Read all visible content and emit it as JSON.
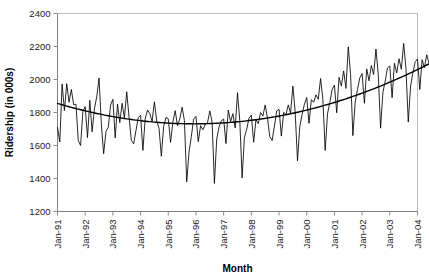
{
  "chart_data": {
    "type": "line",
    "title": "",
    "xlabel": "Month",
    "ylabel": "Ridership (in 000s)",
    "ylim": [
      1200,
      2400
    ],
    "ytick_step": 200,
    "yticks": [
      1200,
      1400,
      1600,
      1800,
      2000,
      2200,
      2400
    ],
    "grid": false,
    "legend": "none",
    "x_tick_labels": [
      "Jan-91",
      "Jan-92",
      "Jan-93",
      "Jan-94",
      "Jan-95",
      "Jan-96",
      "Jan-97",
      "Jan-98",
      "Jan-99",
      "Jan-00",
      "Jan-01",
      "Jan-02",
      "Jan-03",
      "Jan-04"
    ],
    "x_start": "Jan-91",
    "x_end": "Jun-04",
    "x_frequency": "monthly",
    "series": [
      {
        "name": "Ridership",
        "style": "thin-line",
        "color": "#000000",
        "values": [
          1709,
          1621,
          1973,
          1812,
          1975,
          1862,
          1940,
          1848,
          1850,
          1630,
          1600,
          1805,
          1836,
          1648,
          1874,
          1683,
          1821,
          1895,
          2009,
          1730,
          1550,
          1684,
          1710,
          1845,
          1880,
          1646,
          1851,
          1739,
          1856,
          1766,
          1926,
          1771,
          1631,
          1610,
          1690,
          1770,
          1782,
          1570,
          1762,
          1815,
          1793,
          1747,
          1865,
          1749,
          1704,
          1535,
          1716,
          1770,
          1762,
          1619,
          1743,
          1811,
          1719,
          1761,
          1832,
          1751,
          1380,
          1560,
          1655,
          1760,
          1776,
          1623,
          1720,
          1695,
          1728,
          1738,
          1810,
          1741,
          1370,
          1640,
          1712,
          1750,
          1760,
          1612,
          1815,
          1745,
          1793,
          1706,
          1920,
          1749,
          1404,
          1649,
          1700,
          1766,
          1784,
          1620,
          1756,
          1732,
          1800,
          1778,
          1846,
          1766,
          1654,
          1630,
          1718,
          1810,
          1820,
          1657,
          1801,
          1788,
          1846,
          1796,
          1960,
          1800,
          1508,
          1716,
          1790,
          1850,
          1891,
          1734,
          1878,
          1862,
          1907,
          1880,
          2006,
          1880,
          1570,
          1792,
          1860,
          1940,
          1966,
          1798,
          2013,
          1960,
          2052,
          1946,
          2198,
          2030,
          1660,
          1862,
          1940,
          2010,
          2036,
          1856,
          2064,
          1992,
          2085,
          2030,
          2184,
          2030,
          1705,
          1920,
          1990,
          2070,
          2082,
          1890,
          2098,
          2040,
          2126,
          2062,
          2219,
          2068,
          1742,
          1960,
          2040,
          2108,
          2124,
          1940,
          2120,
          2072,
          2150,
          2096
        ]
      }
    ],
    "trend": {
      "name": "Polynomial trend",
      "style": "thick-line",
      "color": "#000000",
      "shape": "quadratic-u",
      "start_value": 1855,
      "min_value": 1737,
      "min_at": "Jan-97",
      "end_value": 2095
    }
  },
  "axes": {
    "y_title": "Ridership (in 000s)",
    "x_title": "Month"
  }
}
